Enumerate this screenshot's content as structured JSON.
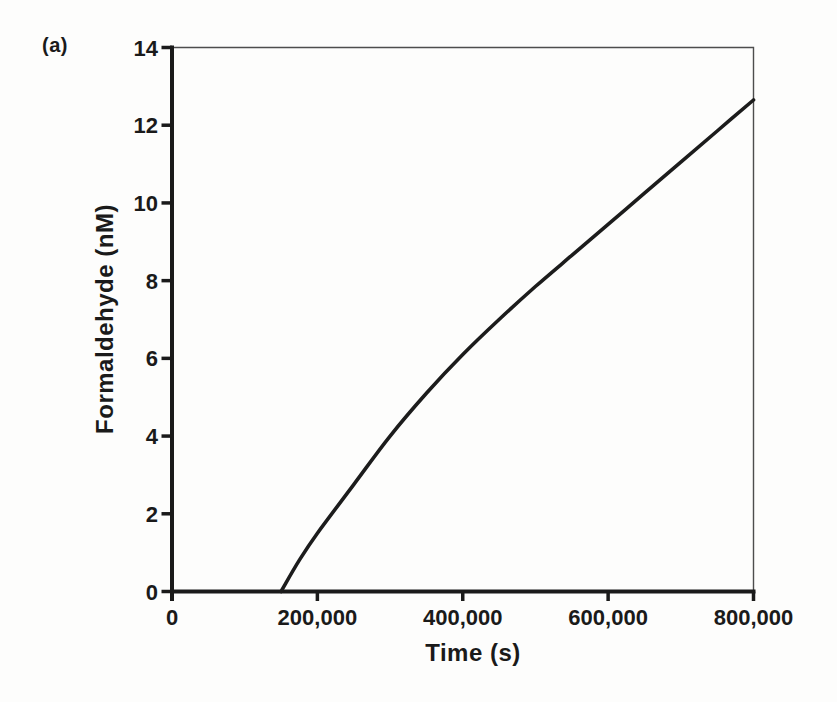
{
  "figure": {
    "panel_label": "(a)"
  },
  "colors": {
    "text": "#1a1a1a",
    "axis": "#1a1a1a",
    "frame": "#4d4d4d",
    "curve": "#1c1c1c",
    "background": "#fdfdfc"
  },
  "chart_data": {
    "type": "line",
    "title": "",
    "xlabel": "Time (s)",
    "ylabel": "Formaldehyde (nM)",
    "xlim": [
      0,
      800000
    ],
    "ylim": [
      0,
      14
    ],
    "grid": false,
    "legend": "none",
    "frame": true,
    "x_ticks": [
      {
        "value": 0,
        "label": "0"
      },
      {
        "value": 200000,
        "label": "200,000"
      },
      {
        "value": 400000,
        "label": "400,000"
      },
      {
        "value": 600000,
        "label": "600,000"
      },
      {
        "value": 800000,
        "label": "800,000"
      }
    ],
    "y_ticks": [
      {
        "value": 0,
        "label": "0"
      },
      {
        "value": 2,
        "label": "2"
      },
      {
        "value": 4,
        "label": "4"
      },
      {
        "value": 6,
        "label": "6"
      },
      {
        "value": 8,
        "label": "8"
      },
      {
        "value": 10,
        "label": "10"
      },
      {
        "value": 12,
        "label": "12"
      },
      {
        "value": 14,
        "label": "14"
      }
    ],
    "series": [
      {
        "name": "Formaldehyde concentration",
        "color": "#1c1c1c",
        "points": [
          [
            150000,
            0.0
          ],
          [
            175000,
            0.8
          ],
          [
            200000,
            1.5
          ],
          [
            250000,
            2.75
          ],
          [
            300000,
            4.0
          ],
          [
            350000,
            5.1
          ],
          [
            400000,
            6.1
          ],
          [
            450000,
            7.0
          ],
          [
            500000,
            7.85
          ],
          [
            550000,
            8.65
          ],
          [
            600000,
            9.45
          ],
          [
            650000,
            10.25
          ],
          [
            700000,
            11.05
          ],
          [
            750000,
            11.85
          ],
          [
            800000,
            12.65
          ]
        ]
      }
    ]
  }
}
